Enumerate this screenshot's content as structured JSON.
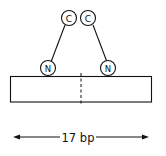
{
  "diagram": {
    "c_labels": [
      "C",
      "C"
    ],
    "n_labels": [
      "N",
      "N"
    ],
    "span_label": "17 bp",
    "stroke_color": "#111111",
    "background": "#ffffff"
  }
}
